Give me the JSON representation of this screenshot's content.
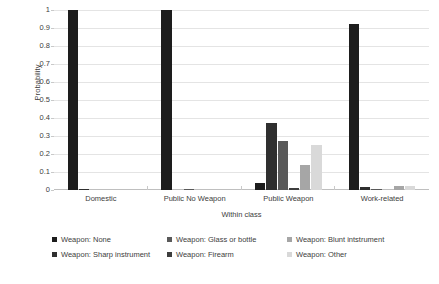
{
  "chart_data": {
    "type": "bar",
    "title": "",
    "subtitle": "",
    "xlabel": "Within class",
    "ylabel": "Probability",
    "ylim": [
      0,
      1
    ],
    "xlim": null,
    "grid": true,
    "grid_axis": "y",
    "legend_position": "bottom",
    "legend_columns": 3,
    "orientation": "vertical",
    "grouping": "grouped",
    "categories": [
      "Domestic",
      "Public No Weapon",
      "Public Weapon",
      "Work-related"
    ],
    "y_ticks": [
      0,
      0.1,
      0.2,
      0.3,
      0.4,
      0.5,
      0.6,
      0.7,
      0.8,
      0.9,
      1
    ],
    "y_tick_labels": [
      "0",
      "0.1",
      "0.2",
      "0.3",
      "0.4",
      "0.5",
      "0.6",
      "0.7",
      "0.8",
      "0.9",
      "1"
    ],
    "series": [
      {
        "name": "Weapon: None",
        "color": "#1d1d1d",
        "values": [
          1.0,
          1.0,
          0.04,
          0.92
        ]
      },
      {
        "name": "Weapon: Sharp instrument",
        "color": "#2f2f2f",
        "values": [
          0.006,
          0.0,
          0.37,
          0.016
        ]
      },
      {
        "name": "Weapon: Glass or bottle",
        "color": "#595959",
        "values": [
          0.0,
          0.005,
          0.27,
          0.004
        ]
      },
      {
        "name": "Weapon: Firearm",
        "color": "#3d3d3d",
        "values": [
          0.0,
          0.0,
          0.012,
          0.0
        ]
      },
      {
        "name": "Weapon: Blunt intstrument",
        "color": "#a6a6a6",
        "values": [
          0.0,
          0.0,
          0.14,
          0.02
        ]
      },
      {
        "name": "Weapon: Other",
        "color": "#d9d9d9",
        "values": [
          0.0,
          0.0,
          0.25,
          0.021
        ]
      }
    ]
  },
  "axes": {
    "y_title": "Probability",
    "x_title": "Within class"
  }
}
